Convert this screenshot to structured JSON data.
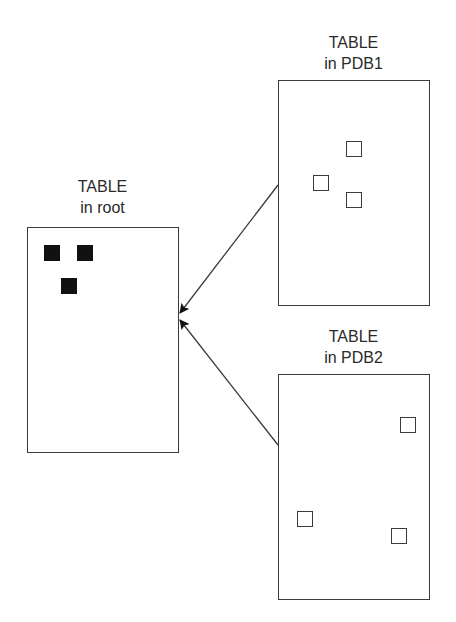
{
  "tables": {
    "root": {
      "title": "TABLE",
      "subtitle": "in root",
      "rows": [
        {
          "x": 44,
          "y": 245,
          "style": "filled"
        },
        {
          "x": 77,
          "y": 245,
          "style": "filled"
        },
        {
          "x": 61,
          "y": 278,
          "style": "filled"
        }
      ]
    },
    "pdb1": {
      "title": "TABLE",
      "subtitle": "in PDB1",
      "rows": [
        {
          "x": 346,
          "y": 141,
          "style": "empty"
        },
        {
          "x": 313,
          "y": 175,
          "style": "empty"
        },
        {
          "x": 346,
          "y": 192,
          "style": "empty"
        }
      ]
    },
    "pdb2": {
      "title": "TABLE",
      "subtitle": "in PDB2",
      "rows": [
        {
          "x": 400,
          "y": 417,
          "style": "empty"
        },
        {
          "x": 297,
          "y": 511,
          "style": "empty"
        },
        {
          "x": 391,
          "y": 528,
          "style": "empty"
        }
      ]
    }
  },
  "arrows": [
    {
      "from": "pdb1",
      "to": "root"
    },
    {
      "from": "pdb2",
      "to": "root"
    }
  ],
  "colors": {
    "line": "#3a3a3a",
    "filled_square": "#111111",
    "background": "#ffffff"
  }
}
